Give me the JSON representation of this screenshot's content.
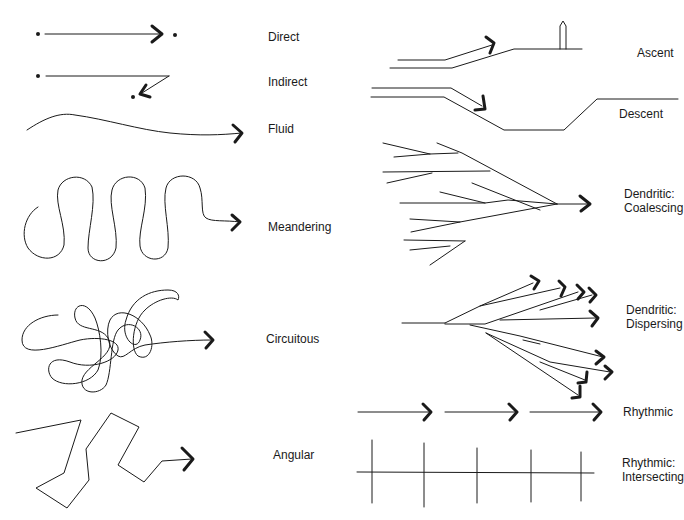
{
  "diagram": {
    "title": "",
    "labels": {
      "direct": "Direct",
      "indirect": "Indirect",
      "fluid": "Fluid",
      "meandering": "Meandering",
      "circuitous": "Circuitous",
      "angular": "Angular",
      "ascent": "Ascent",
      "descent": "Descent",
      "dendritic_coalescing": "Dendritic:\nCoalescing",
      "dendritic_dispersing": "Dendritic:\nDispersing",
      "rhythmic": "Rhythmic",
      "rhythmic_intersecting": "Rhythmic:\nIntersecting"
    },
    "colors": {
      "stroke": "#1a1a1a",
      "background": "#ffffff"
    }
  }
}
